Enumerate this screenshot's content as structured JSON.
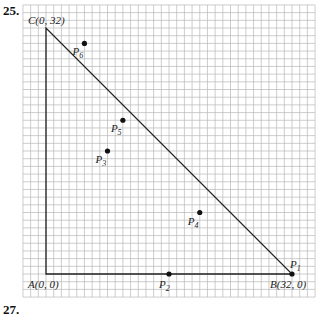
{
  "problem_numbers": {
    "top": "25.",
    "bottom": "27."
  },
  "grid": {
    "unit": 1,
    "x_range": [
      -3,
      35
    ],
    "y_range": [
      -3,
      35
    ],
    "color": "#b8b8b8"
  },
  "triangle": {
    "vertices": [
      {
        "name": "A",
        "label": "A(0, 0)",
        "x": 0,
        "y": 0
      },
      {
        "name": "B",
        "label": "B(32, 0)",
        "x": 32,
        "y": 0
      },
      {
        "name": "C",
        "label": "C(0, 32)",
        "x": 0,
        "y": 32
      }
    ]
  },
  "points": [
    {
      "name": "P1",
      "label": "P",
      "sub": "1",
      "x": 32,
      "y": 0
    },
    {
      "name": "P2",
      "label": "P",
      "sub": "2",
      "x": 16,
      "y": 0
    },
    {
      "name": "P3",
      "label": "P",
      "sub": "3",
      "x": 8,
      "y": 16
    },
    {
      "name": "P4",
      "label": "P",
      "sub": "4",
      "x": 20,
      "y": 8
    },
    {
      "name": "P5",
      "label": "P",
      "sub": "5",
      "x": 10,
      "y": 20
    },
    {
      "name": "P6",
      "label": "P",
      "sub": "6",
      "x": 5,
      "y": 30
    }
  ]
}
